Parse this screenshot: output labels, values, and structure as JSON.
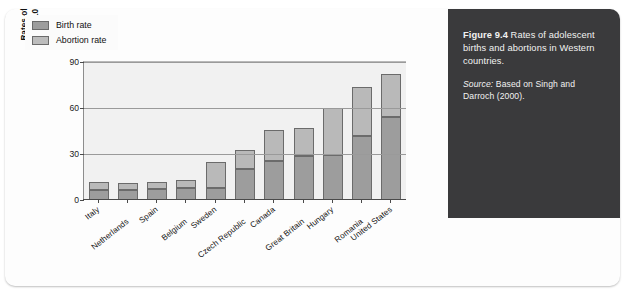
{
  "figure": {
    "number_label": "Figure 9.4",
    "caption_text": " Rates of adolescent births and abortions in Western countries.",
    "source_label": "Source:",
    "source_text": " Based on Singh and Darroch (2000)."
  },
  "chart_data": {
    "type": "bar",
    "subtype": "stacked",
    "title": "",
    "xlabel": "",
    "ylabel": "Rates of births and abortions per 1000 girls aged 15–19",
    "ylabel_line1": "Rates of births and abortions",
    "ylabel_line2": "per 1000 girls aged 15–19",
    "ylim": [
      0,
      90
    ],
    "yticks": [
      0,
      30,
      60,
      90
    ],
    "ytick_labels": [
      "0",
      "30",
      "60",
      "90"
    ],
    "grid": true,
    "legend_position": "top-left",
    "categories": [
      "Italy",
      "Netherlands",
      "Spain",
      "Belgium",
      "Sweden",
      "Czech Republic",
      "Canada",
      "Great Britain",
      "Hungary",
      "Romania",
      "United States"
    ],
    "series": [
      {
        "name": "Birth rate",
        "color": "#9d9d9d",
        "values": [
          6.6,
          6.8,
          7.0,
          7.7,
          7.7,
          20.1,
          25.4,
          29.0,
          29.5,
          41.6,
          54.4
        ]
      },
      {
        "name": "Abortion rate",
        "color": "#b9b9b9",
        "values": [
          5.1,
          4.2,
          4.9,
          5.2,
          17.2,
          12.4,
          20.5,
          18.0,
          30.5,
          32.4,
          28.1
        ]
      }
    ],
    "totals": [
      11.7,
      11.0,
      11.9,
      12.9,
      24.9,
      32.5,
      45.9,
      47.0,
      60.0,
      74.0,
      82.5
    ]
  },
  "legend": {
    "items": [
      {
        "label": "Birth rate",
        "color": "#9d9d9d"
      },
      {
        "label": "Abortion rate",
        "color": "#bcbcbc"
      }
    ]
  }
}
